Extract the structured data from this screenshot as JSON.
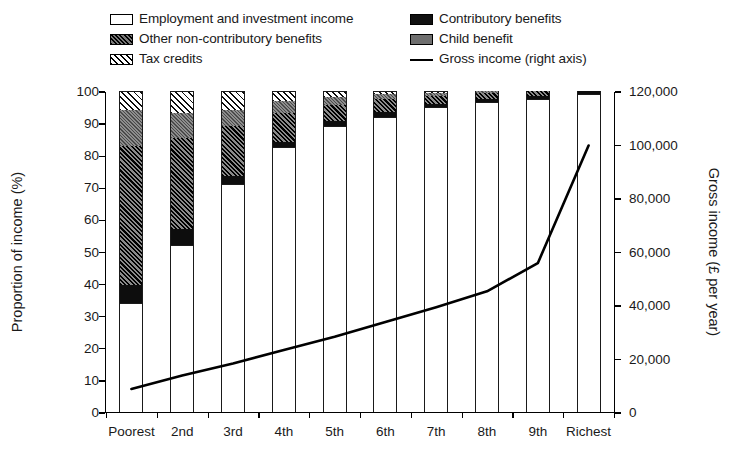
{
  "chart_data": {
    "type": "bar",
    "title": "",
    "subtitle": "",
    "stacked": true,
    "categories": [
      "Poorest",
      "2nd",
      "3rd",
      "4th",
      "5th",
      "6th",
      "7th",
      "8th",
      "9th",
      "Richest"
    ],
    "xlabel": "",
    "ylabel": "Proportion of income (%)",
    "ylim": [
      0,
      100
    ],
    "yticks": [
      0,
      10,
      20,
      30,
      40,
      50,
      60,
      70,
      80,
      90,
      100
    ],
    "y2label": "Gross income (£ per year)",
    "y2lim": [
      0,
      120000
    ],
    "y2ticks": [
      "0",
      "20,000",
      "40,000",
      "60,000",
      "80,000",
      "100,000",
      "120,000"
    ],
    "y2ticks_values": [
      0,
      20000,
      40000,
      60000,
      80000,
      100000,
      120000
    ],
    "grid": false,
    "legend_position": "top",
    "series": [
      {
        "name": "Employment and investment income",
        "pattern": "white",
        "values": [
          34,
          52,
          71,
          82.5,
          89,
          92,
          95,
          96.5,
          97.5,
          99
        ]
      },
      {
        "name": "Contributory benefits",
        "pattern": "solid-black",
        "values": [
          5.5,
          5,
          2.5,
          1.5,
          1.5,
          1.5,
          1,
          1,
          1,
          1
        ]
      },
      {
        "name": "Other non-contributory benefits",
        "pattern": "dense-diagonal-hatch",
        "values": [
          43.5,
          28.5,
          15.5,
          9,
          5,
          4,
          2.5,
          2,
          1.5,
          0
        ]
      },
      {
        "name": "Child benefit",
        "pattern": "grey",
        "values": [
          11,
          7.5,
          5,
          4,
          2.5,
          1.5,
          1,
          0.5,
          0,
          0
        ]
      },
      {
        "name": "Tax credits",
        "pattern": "light-diagonal-hatch",
        "values": [
          6,
          7,
          6,
          3,
          2,
          1,
          0.5,
          0,
          0,
          0
        ]
      }
    ],
    "line_series": {
      "name": "Gross income (right axis)",
      "label": "Gross income (right axis)",
      "axis": "right",
      "unit": "£ per year",
      "values": [
        9000,
        14000,
        18500,
        23500,
        28500,
        34000,
        39500,
        45500,
        56000,
        100000
      ]
    }
  },
  "legend": {
    "items": [
      {
        "label": "Employment and investment income",
        "swatch": "white",
        "column": "a",
        "row": 0
      },
      {
        "label": "Other non-contributory benefits",
        "swatch": "dense",
        "column": "a",
        "row": 1
      },
      {
        "label": "Tax credits",
        "swatch": "tax",
        "column": "a",
        "row": 2
      },
      {
        "label": "Contributory benefits",
        "swatch": "black",
        "column": "b",
        "row": 0
      },
      {
        "label": "Child benefit",
        "swatch": "gray",
        "column": "b",
        "row": 1
      },
      {
        "label": "Gross income (right axis)",
        "swatch": "line",
        "column": "b",
        "row": 2
      }
    ]
  },
  "colors": {
    "ink": "#1a1a1a",
    "background": "#ffffff",
    "contributory": "#0d0d0d",
    "child_benefit": "#6d6d6d",
    "line": "#000000"
  }
}
